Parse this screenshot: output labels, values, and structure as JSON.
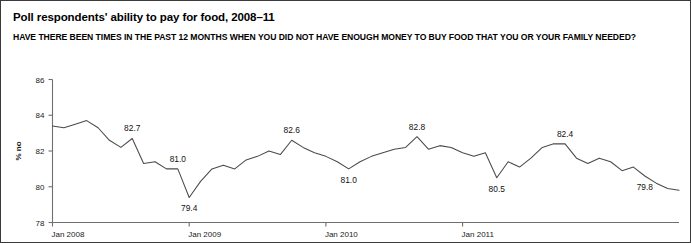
{
  "figure": {
    "title": "Poll respondents' ability to pay for food, 2008–11",
    "subtitle": "HAVE THERE BEEN TIMES IN THE PAST 12 MONTHS WHEN YOU DID NOT HAVE ENOUGH MONEY TO BUY FOOD THAT YOU OR YOUR FAMILY NEEDED?",
    "border_color": "#3a3a3a",
    "background": "#ffffff",
    "line_color": "#4a4a4a"
  },
  "chart_data": {
    "type": "line",
    "title": "Poll respondents' ability to pay for food, 2008–11",
    "subtitle": "HAVE THERE BEEN TIMES IN THE PAST 12 MONTHS WHEN YOU DID NOT HAVE ENOUGH MONEY TO BUY FOOD THAT YOU OR YOUR FAMILY NEEDED?",
    "xlabel": "",
    "ylabel": "% no",
    "ylim": [
      78,
      86
    ],
    "yticks": [
      78,
      80,
      82,
      84,
      86
    ],
    "ytick_labels": [
      "78",
      "80",
      "82",
      "84",
      "86"
    ],
    "xlim": [
      "Jan 2008",
      "Dec 2011"
    ],
    "xticks": [
      0,
      12,
      24,
      36
    ],
    "xtick_labels": [
      "Jan 2008",
      "Jan 2009",
      "Jan 2010",
      "Jan 2011"
    ],
    "grid": false,
    "legend": false,
    "x": [
      0,
      1,
      2,
      3,
      4,
      5,
      6,
      7,
      8,
      9,
      10,
      11,
      12,
      13,
      14,
      15,
      16,
      17,
      18,
      19,
      20,
      21,
      22,
      23,
      24,
      25,
      26,
      27,
      28,
      29,
      30,
      31,
      32,
      33,
      34,
      35,
      36,
      37,
      38,
      39,
      40,
      41,
      42,
      43,
      44,
      45,
      46
    ],
    "series": [
      {
        "name": "% no",
        "values": [
          83.4,
          83.3,
          83.5,
          83.7,
          83.3,
          82.6,
          82.2,
          82.7,
          81.3,
          81.4,
          81.0,
          81.0,
          79.4,
          80.3,
          81.0,
          81.2,
          81.0,
          81.5,
          81.7,
          82.0,
          81.8,
          82.6,
          82.2,
          81.9,
          81.7,
          81.4,
          81.0,
          81.4,
          81.7,
          81.9,
          82.1,
          82.2,
          82.8,
          82.1,
          82.3,
          82.2,
          81.9,
          81.7,
          81.9,
          80.5,
          81.4,
          81.1,
          81.6,
          82.2,
          82.4,
          82.4,
          81.6
        ]
      }
    ],
    "point_labels": [
      {
        "index": 7,
        "value": 82.7,
        "text": "82.7",
        "position": "above"
      },
      {
        "index": 11,
        "value": 81.0,
        "text": "81.0",
        "position": "above"
      },
      {
        "index": 12,
        "value": 79.4,
        "text": "79.4",
        "position": "below"
      },
      {
        "index": 21,
        "value": 82.6,
        "text": "82.6",
        "position": "above"
      },
      {
        "index": 26,
        "value": 81.0,
        "text": "81.0",
        "position": "below"
      },
      {
        "index": 32,
        "value": 82.8,
        "text": "82.8",
        "position": "above"
      },
      {
        "index": 39,
        "value": 80.5,
        "text": "80.5",
        "position": "below"
      },
      {
        "index": 45,
        "value": 82.4,
        "text": "82.4",
        "position": "above"
      },
      {
        "index": 52,
        "value": 79.8,
        "text": "79.8",
        "position": "below"
      }
    ],
    "tail_values": [
      81.3,
      81.6,
      81.4,
      80.9,
      81.1,
      80.6,
      80.2,
      79.9,
      79.8
    ]
  }
}
